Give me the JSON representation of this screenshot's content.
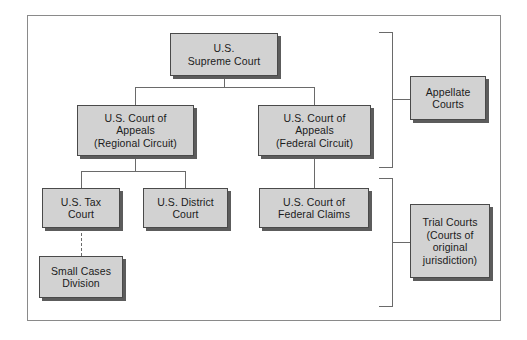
{
  "diagram": {
    "background_color": "#ffffff",
    "node_fill_color": "#d2d2d2",
    "node_border_color": "#4a4a4a",
    "shadow_color": "#5c5c5c",
    "line_color": "#6a6a6a",
    "frame_border_color": "#8a8a8a"
  },
  "nodes": {
    "supreme_court": {
      "line1": "U.S.",
      "line2": "Supreme Court"
    },
    "appeals_regional": {
      "line1": "U.S. Court of",
      "line2": "Appeals",
      "line3": "(Regional Circuit)"
    },
    "appeals_federal": {
      "line1": "U.S. Court of",
      "line2": "Appeals",
      "line3": "(Federal Circuit)"
    },
    "tax_court": {
      "line1": "U.S. Tax",
      "line2": "Court"
    },
    "district_court": {
      "line1": "U.S. District",
      "line2": "Court"
    },
    "federal_claims": {
      "line1": "U.S. Court of",
      "line2": "Federal Claims"
    },
    "small_cases": {
      "line1": "Small Cases",
      "line2": "Division"
    },
    "appellate_courts": {
      "line1": "Appellate",
      "line2": "Courts"
    },
    "trial_courts": {
      "line1": "Trial Courts",
      "line2": "(Courts of",
      "line3": "original",
      "line4": "jurisdiction)"
    }
  }
}
